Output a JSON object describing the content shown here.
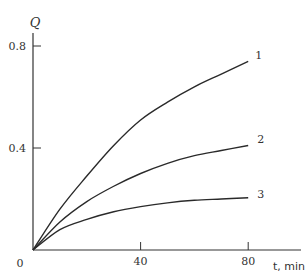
{
  "chart_data": {
    "type": "line",
    "title": "",
    "xlabel": "t, min",
    "ylabel": "Q",
    "xlim": [
      0,
      80
    ],
    "ylim": [
      0,
      0.85
    ],
    "x_ticks": [
      40,
      80
    ],
    "x_tick_labels": [
      "40",
      "80"
    ],
    "y_ticks": [
      0.4,
      0.8
    ],
    "y_tick_labels": [
      "0.4",
      "0.8"
    ],
    "origin_label": "0",
    "grid": false,
    "legend": "inline curve labels at right end",
    "x": [
      0,
      10,
      20,
      30,
      40,
      50,
      60,
      70,
      80
    ],
    "series": [
      {
        "name": "1",
        "values": [
          0,
          0.16,
          0.29,
          0.41,
          0.51,
          0.58,
          0.64,
          0.69,
          0.74
        ]
      },
      {
        "name": "2",
        "values": [
          0,
          0.11,
          0.19,
          0.25,
          0.3,
          0.34,
          0.37,
          0.39,
          0.41
        ]
      },
      {
        "name": "3",
        "values": [
          0,
          0.08,
          0.12,
          0.15,
          0.17,
          0.185,
          0.195,
          0.2,
          0.205
        ]
      }
    ]
  },
  "plot": {
    "px_origin_x": 33,
    "px_origin_y": 250,
    "px_per_x": 2.69,
    "px_per_y": 255
  }
}
